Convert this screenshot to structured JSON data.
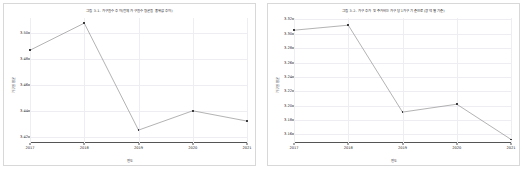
{
  "charts": [
    {
      "id": "left",
      "title": "그림 3-1. 가구원수 추이(전체 가구원수 평균을 중위값 추이)",
      "xlabel": "연도",
      "ylabel": "가구원 평균",
      "categories": [
        "2017",
        "2018",
        "2019",
        "2020",
        "2021"
      ],
      "values": [
        3.487,
        3.508,
        3.425,
        3.44,
        3.432
      ],
      "yticks": [
        "3.42",
        "3.44",
        "3.46",
        "3.48",
        "3.50"
      ],
      "ytick_values": [
        3.42,
        3.44,
        3.46,
        3.48,
        3.5
      ],
      "ylim": [
        3.415,
        3.512
      ],
      "line_color": "#7f7f7f",
      "marker_color": "#3c3c3c"
    },
    {
      "id": "right",
      "title": "그림 3-2. 가구 추가 및 주거비는 가구당 1가구 기준으로 (광역 별 기준)",
      "xlabel": "연도",
      "ylabel": "가구원 평균",
      "categories": [
        "2017",
        "2018",
        "2019",
        "2020",
        "2021"
      ],
      "values": [
        3.305,
        3.312,
        3.191,
        3.202,
        3.153
      ],
      "yticks": [
        "3.16",
        "3.18",
        "3.20",
        "3.22",
        "3.24",
        "3.26",
        "3.28",
        "3.30",
        "3.32"
      ],
      "ytick_values": [
        3.16,
        3.18,
        3.2,
        3.22,
        3.24,
        3.26,
        3.28,
        3.3,
        3.32
      ],
      "ylim": [
        3.148,
        3.322
      ],
      "line_color": "#7f7f7f",
      "marker_color": "#3c3c3c"
    }
  ],
  "chart_data": [
    {
      "type": "line",
      "title": "그림 3-1. 가구원수 추이(전체 가구원수 평균을 중위값 추이)",
      "xlabel": "연도",
      "ylabel": "가구원 평균",
      "categories": [
        "2017",
        "2018",
        "2019",
        "2020",
        "2021"
      ],
      "values": [
        3.487,
        3.508,
        3.425,
        3.44,
        3.432
      ],
      "ylim": [
        3.415,
        3.512
      ],
      "ytick_values": [
        3.42,
        3.44,
        3.46,
        3.48,
        3.5
      ],
      "grid": true,
      "legend": "none",
      "markers": true
    },
    {
      "type": "line",
      "title": "그림 3-2. 가구 추가 및 주거비는 가구당 1가구 기준으로 (광역 별 기준)",
      "xlabel": "연도",
      "ylabel": "가구원 평균",
      "categories": [
        "2017",
        "2018",
        "2019",
        "2020",
        "2021"
      ],
      "values": [
        3.305,
        3.312,
        3.191,
        3.202,
        3.153
      ],
      "ylim": [
        3.148,
        3.322
      ],
      "ytick_values": [
        3.16,
        3.18,
        3.2,
        3.22,
        3.24,
        3.26,
        3.28,
        3.3,
        3.32
      ],
      "grid": true,
      "legend": "none",
      "markers": true
    }
  ]
}
